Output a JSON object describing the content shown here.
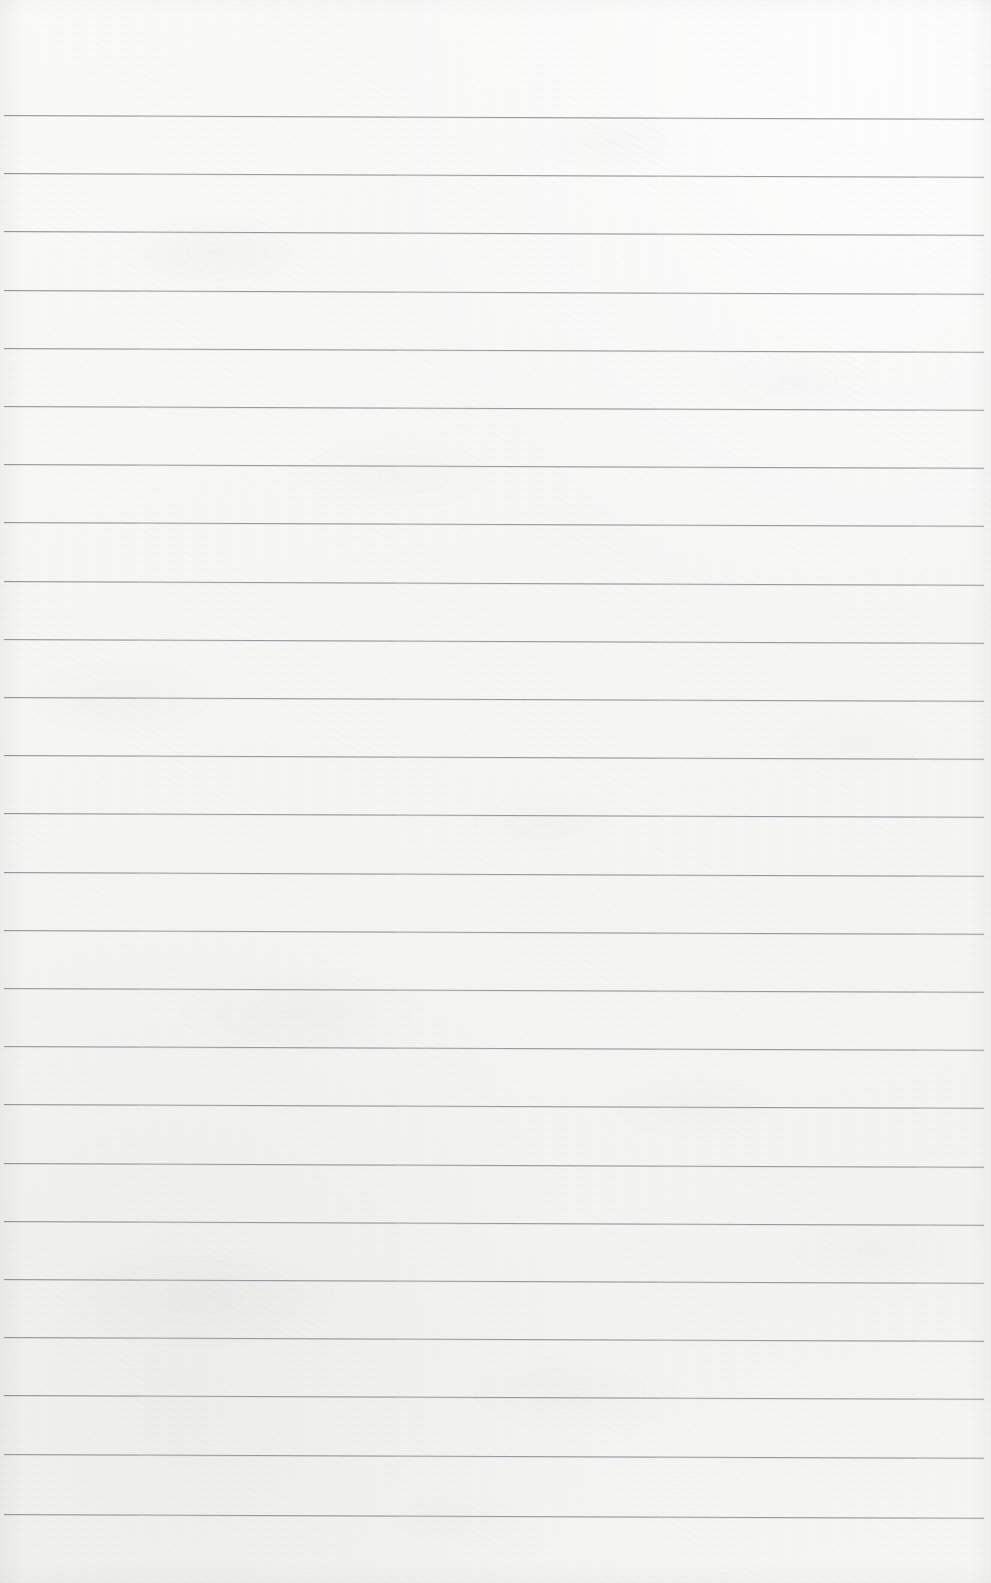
{
  "page": {
    "kind": "scanned-ruled-notebook-page",
    "width": 991,
    "height": 1583,
    "has_text_content": false,
    "handwriting_present": false,
    "printed_text_present": false
  },
  "paper": {
    "background_color": "#f7f7f6",
    "highlight_color": "#fbfbfa",
    "shadow_color": "#f1f1f0",
    "texture": "mottled fibrous scan grain",
    "top_margin_px": 115,
    "bottom_margin_px": 69
  },
  "ruling": {
    "type": "horizontal-ruled",
    "line_color": "#8e9196",
    "line_thickness_px": 1.4,
    "line_spacing_px": 58.3,
    "first_line_y_px": 115,
    "last_line_y_px": 1514,
    "line_start_x_px": 4,
    "line_end_x_px": 984,
    "line_count": 25,
    "skew_degrees": 0.22,
    "margin_rule_present": false,
    "holes_present": false,
    "line_y_positions": [
      115,
      173,
      231,
      290,
      348,
      406,
      464,
      522,
      581,
      639,
      697,
      755,
      813,
      872,
      930,
      988,
      1046,
      1104,
      1163,
      1221,
      1279,
      1337,
      1395,
      1454,
      1514
    ]
  }
}
